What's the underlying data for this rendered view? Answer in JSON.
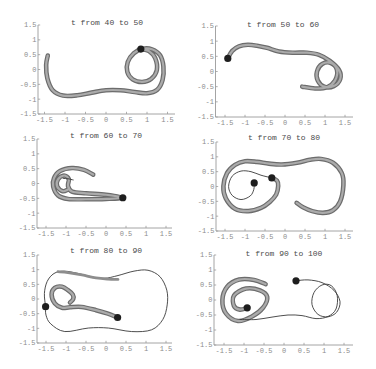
{
  "chart_data": [
    {
      "type": "line",
      "title": "t from 40 to 50",
      "xlabel": "",
      "ylabel": "",
      "xlim": [
        -1.5,
        1.5
      ],
      "ylim": [
        -1.5,
        1.5
      ],
      "grid": false,
      "legend": null,
      "xticks": [
        -1.5,
        -1,
        -0.5,
        0,
        0.5,
        1,
        1.5
      ],
      "xtick_labels": [
        "-1.5",
        "-1",
        "-0.5",
        "0",
        "0.5",
        "1",
        "1.5"
      ],
      "yticks": [
        1.5,
        1,
        0.5,
        0,
        -0.5,
        -1,
        -1.5
      ],
      "ytick_labels": [
        "1.5",
        "1",
        "0.5",
        "0",
        "-0.5",
        "-1",
        "-1.5"
      ],
      "series": [
        {
          "name": "thick trajectory",
          "style": "thick",
          "points": [
            [
              -1.42,
              0.47
            ],
            [
              -1.46,
              0.15
            ],
            [
              -1.43,
              -0.3
            ],
            [
              -1.3,
              -0.7
            ],
            [
              -1.05,
              -0.88
            ],
            [
              -0.7,
              -0.87
            ],
            [
              -0.35,
              -0.78
            ],
            [
              0.0,
              -0.7
            ],
            [
              0.35,
              -0.7
            ],
            [
              0.7,
              -0.76
            ],
            [
              1.0,
              -0.8
            ],
            [
              1.25,
              -0.68
            ],
            [
              1.38,
              -0.35
            ],
            [
              1.4,
              0.1
            ],
            [
              1.32,
              0.48
            ],
            [
              1.12,
              0.68
            ],
            [
              0.9,
              0.7
            ],
            [
              0.68,
              0.55
            ],
            [
              0.53,
              0.25
            ],
            [
              0.52,
              -0.08
            ],
            [
              0.65,
              -0.33
            ],
            [
              0.88,
              -0.42
            ],
            [
              1.1,
              -0.32
            ],
            [
              1.24,
              -0.02
            ],
            [
              1.2,
              0.38
            ],
            [
              1.05,
              0.62
            ],
            [
              0.85,
              0.69
            ]
          ]
        }
      ],
      "markers": [
        [
          0.85,
          0.69
        ]
      ]
    },
    {
      "type": "line",
      "title": "t from 50 to 60",
      "xlabel": "",
      "ylabel": "",
      "xlim": [
        -1.5,
        1.5
      ],
      "ylim": [
        -1.5,
        1.5
      ],
      "grid": false,
      "legend": null,
      "xticks": [
        -1.5,
        -1,
        -0.5,
        0,
        0.5,
        1,
        1.5
      ],
      "xtick_labels": [
        "-1.5",
        "-1",
        "-0.5",
        "0",
        "0.5",
        "1",
        "1.5"
      ],
      "yticks": [
        1.5,
        1,
        0.5,
        0,
        -0.5,
        -1,
        -1.5
      ],
      "ytick_labels": [
        "1.5",
        "1",
        "0.5",
        "0",
        "-0.5",
        "-1",
        "-1.5"
      ],
      "series": [
        {
          "name": "thick trajectory",
          "style": "thick",
          "points": [
            [
              -1.43,
              0.43
            ],
            [
              -1.32,
              0.68
            ],
            [
              -1.15,
              0.83
            ],
            [
              -0.93,
              0.88
            ],
            [
              -0.7,
              0.85
            ],
            [
              -0.45,
              0.78
            ],
            [
              -0.15,
              0.66
            ],
            [
              0.2,
              0.62
            ],
            [
              0.55,
              0.62
            ],
            [
              0.85,
              0.55
            ],
            [
              1.12,
              0.35
            ],
            [
              1.35,
              0.05
            ],
            [
              1.38,
              -0.25
            ],
            [
              1.22,
              -0.48
            ],
            [
              0.98,
              -0.5
            ],
            [
              0.82,
              -0.3
            ],
            [
              0.8,
              0.0
            ],
            [
              0.93,
              0.25
            ],
            [
              1.15,
              0.28
            ],
            [
              1.3,
              0.05
            ],
            [
              1.25,
              -0.3
            ],
            [
              1.05,
              -0.52
            ],
            [
              0.75,
              -0.56
            ],
            [
              0.43,
              -0.5
            ]
          ]
        }
      ],
      "markers": [
        [
          -1.43,
          0.43
        ]
      ]
    },
    {
      "type": "line",
      "title": "t from 60 to 70",
      "xlabel": "",
      "ylabel": "",
      "xlim": [
        -1.5,
        1.5
      ],
      "ylim": [
        -1.5,
        1.5
      ],
      "grid": false,
      "legend": null,
      "xticks": [
        -1.5,
        -1,
        -0.5,
        0,
        0.5,
        1,
        1.5
      ],
      "xtick_labels": [
        "-1.5",
        "-1",
        "-0.5",
        "0",
        "0.5",
        "1",
        "1.5"
      ],
      "yticks": [
        1.5,
        1,
        0.5,
        0,
        -0.5,
        -1,
        -1.5
      ],
      "ytick_labels": [
        "1.5",
        "1",
        "0.5",
        "0",
        "-0.5",
        "-1",
        "-1.5"
      ],
      "series": [
        {
          "name": "thick trajectory",
          "style": "thick",
          "points": [
            [
              -0.32,
              0.3
            ],
            [
              -0.55,
              0.46
            ],
            [
              -0.85,
              0.52
            ],
            [
              -1.15,
              0.42
            ],
            [
              -1.3,
              0.18
            ],
            [
              -1.32,
              -0.1
            ],
            [
              -1.2,
              -0.4
            ],
            [
              -0.95,
              -0.52
            ],
            [
              -0.5,
              -0.53
            ],
            [
              0.0,
              -0.52
            ],
            [
              0.42,
              -0.48
            ],
            [
              0.0,
              -0.38
            ],
            [
              -0.5,
              -0.33
            ],
            [
              -0.85,
              -0.27
            ],
            [
              -0.95,
              -0.08
            ],
            [
              -0.93,
              0.15
            ],
            [
              -1.05,
              0.27
            ],
            [
              -1.2,
              0.14
            ],
            [
              -1.22,
              -0.1
            ],
            [
              -1.08,
              -0.26
            ],
            [
              -0.95,
              -0.2
            ]
          ]
        },
        {
          "name": "thin trajectory",
          "style": "thin",
          "points": [
            [
              -1.07,
              0.17
            ],
            [
              -0.95,
              0.16
            ],
            [
              -0.82,
              0.12
            ]
          ]
        }
      ],
      "markers": [
        [
          0.42,
          -0.48
        ]
      ]
    },
    {
      "type": "line",
      "title": "t from 70 to 80",
      "xlabel": "",
      "ylabel": "",
      "xlim": [
        -1.5,
        1.5
      ],
      "ylim": [
        -1.5,
        1.5
      ],
      "grid": false,
      "legend": null,
      "xticks": [
        -1.5,
        -1,
        -0.5,
        0,
        0.5,
        1,
        1.5
      ],
      "xtick_labels": [
        "-1.5",
        "-1",
        "-0.5",
        "0",
        "0.5",
        "1",
        "1.5"
      ],
      "yticks": [
        1.5,
        1,
        0.5,
        0,
        -0.5,
        -1,
        -1.5
      ],
      "ytick_labels": [
        "1.5",
        "1",
        "0.5",
        "0",
        "-0.5",
        "-1",
        "-1.5"
      ],
      "series": [
        {
          "name": "thick trajectory",
          "style": "thick",
          "points": [
            [
              -0.33,
              0.29
            ],
            [
              -0.2,
              0.2
            ],
            [
              -0.17,
              0.02
            ],
            [
              -0.22,
              -0.27
            ],
            [
              -0.38,
              -0.52
            ],
            [
              -0.6,
              -0.72
            ],
            [
              -0.92,
              -0.83
            ],
            [
              -1.25,
              -0.75
            ],
            [
              -1.48,
              -0.4
            ],
            [
              -1.54,
              0.01
            ],
            [
              -1.45,
              0.45
            ],
            [
              -1.25,
              0.73
            ],
            [
              -1.0,
              0.85
            ],
            [
              -0.7,
              0.83
            ],
            [
              -0.4,
              0.77
            ],
            [
              -0.08,
              0.74
            ],
            [
              0.3,
              0.8
            ],
            [
              0.62,
              0.9
            ],
            [
              0.9,
              0.93
            ],
            [
              1.2,
              0.8
            ],
            [
              1.42,
              0.45
            ],
            [
              1.46,
              0.05
            ],
            [
              1.38,
              -0.5
            ],
            [
              1.2,
              -0.8
            ],
            [
              0.95,
              -0.89
            ],
            [
              0.68,
              -0.83
            ],
            [
              0.45,
              -0.7
            ],
            [
              0.29,
              -0.55
            ]
          ]
        },
        {
          "name": "thin trajectory",
          "style": "thin",
          "points": [
            [
              -0.77,
              0.12
            ],
            [
              -0.78,
              -0.1
            ],
            [
              -0.87,
              -0.32
            ],
            [
              -1.1,
              -0.44
            ],
            [
              -1.32,
              -0.3
            ],
            [
              -1.41,
              0.0
            ],
            [
              -1.32,
              0.35
            ],
            [
              -1.1,
              0.52
            ],
            [
              -0.85,
              0.5
            ],
            [
              -0.6,
              0.38
            ],
            [
              -0.33,
              0.29
            ]
          ]
        }
      ],
      "markers": [
        [
          -0.77,
          0.12
        ],
        [
          -0.33,
          0.29
        ]
      ]
    },
    {
      "type": "line",
      "title": "t from 80 to 90",
      "xlabel": "",
      "ylabel": "",
      "xlim": [
        -1.5,
        1.5
      ],
      "ylim": [
        -1.5,
        1.5
      ],
      "grid": false,
      "legend": null,
      "xticks": [
        -1.5,
        -1,
        -0.5,
        0,
        0.5,
        1,
        1.5
      ],
      "xtick_labels": [
        "-1.5",
        "-1",
        "-0.5",
        "0",
        "0.5",
        "1",
        "1.5"
      ],
      "yticks": [
        1.5,
        1,
        0.5,
        0,
        -0.5,
        -1,
        -1.5
      ],
      "ytick_labels": [
        "1.5",
        "1",
        "0.5",
        "0",
        "-0.5",
        "-1",
        "-1.5"
      ],
      "series": [
        {
          "name": "thin trajectory",
          "style": "thin",
          "points": [
            [
              -1.51,
              -0.26
            ],
            [
              -1.54,
              0.19
            ],
            [
              -1.47,
              0.6
            ],
            [
              -1.3,
              0.87
            ],
            [
              -1.05,
              0.95
            ],
            [
              -0.69,
              0.87
            ],
            [
              -0.35,
              0.75
            ],
            [
              -0.05,
              0.7
            ],
            [
              0.3,
              0.8
            ],
            [
              0.7,
              0.95
            ],
            [
              1.05,
              0.98
            ],
            [
              1.35,
              0.76
            ],
            [
              1.52,
              0.3
            ],
            [
              1.53,
              -0.2
            ],
            [
              1.42,
              -0.7
            ],
            [
              1.14,
              -1.05
            ],
            [
              0.64,
              -1.11
            ],
            [
              0.06,
              -0.99
            ],
            [
              -0.44,
              -0.99
            ],
            [
              -1.03,
              -1.11
            ],
            [
              -1.38,
              -0.85
            ],
            [
              -1.5,
              -0.55
            ],
            [
              -1.51,
              -0.26
            ]
          ]
        },
        {
          "name": "medium trajectory",
          "style": "medium",
          "points": [
            [
              -1.2,
              0.93
            ],
            [
              -0.95,
              0.9
            ],
            [
              -0.6,
              0.82
            ],
            [
              -0.25,
              0.72
            ],
            [
              0.05,
              0.68
            ],
            [
              0.3,
              0.67
            ]
          ]
        },
        {
          "name": "thick trajectory",
          "style": "thick",
          "points": [
            [
              0.29,
              -0.63
            ],
            [
              0.05,
              -0.5
            ],
            [
              -0.25,
              -0.38
            ],
            [
              -0.61,
              -0.27
            ],
            [
              -0.9,
              -0.28
            ],
            [
              -1.1,
              -0.3
            ],
            [
              -1.28,
              -0.15
            ],
            [
              -1.36,
              0.15
            ],
            [
              -1.28,
              0.38
            ],
            [
              -1.1,
              0.42
            ],
            [
              -0.95,
              0.3
            ],
            [
              -0.83,
              0.15
            ],
            [
              -0.82,
              0.0
            ],
            [
              -0.9,
              -0.12
            ]
          ]
        }
      ],
      "markers": [
        [
          -1.51,
          -0.26
        ],
        [
          0.29,
          -0.63
        ]
      ]
    },
    {
      "type": "line",
      "title": "t from 90 to 100",
      "xlabel": "",
      "ylabel": "",
      "xlim": [
        -1.5,
        1.5
      ],
      "ylim": [
        -1.5,
        1.5
      ],
      "grid": false,
      "legend": null,
      "xticks": [
        -1.5,
        -1,
        -0.5,
        0,
        0.5,
        1,
        1.5
      ],
      "xtick_labels": [
        "-1.5",
        "-1",
        "-0.5",
        "0",
        "0.5",
        "1",
        "1.5"
      ],
      "yticks": [
        1.5,
        1,
        0.5,
        0,
        -0.5,
        -1,
        -1.5
      ],
      "ytick_labels": [
        "1.5",
        "1",
        "0.5",
        "0",
        "-0.5",
        "-1",
        "-1.5"
      ],
      "series": [
        {
          "name": "thick trajectory",
          "style": "thick",
          "points": [
            [
              -0.46,
              0.53
            ],
            [
              -0.75,
              0.67
            ],
            [
              -1.12,
              0.68
            ],
            [
              -1.42,
              0.44
            ],
            [
              -1.54,
              0.0
            ],
            [
              -1.45,
              -0.45
            ],
            [
              -1.15,
              -0.7
            ],
            [
              -0.8,
              -0.55
            ],
            [
              -0.52,
              -0.25
            ],
            [
              -0.42,
              0.1
            ],
            [
              -0.6,
              0.32
            ],
            [
              -0.95,
              0.38
            ],
            [
              -1.25,
              0.15
            ],
            [
              -1.25,
              -0.2
            ],
            [
              -1.1,
              -0.32
            ],
            [
              -0.92,
              -0.26
            ]
          ]
        },
        {
          "name": "thin trajectory",
          "style": "thin",
          "points": [
            [
              0.3,
              0.64
            ],
            [
              0.6,
              0.67
            ],
            [
              0.95,
              0.58
            ],
            [
              1.25,
              0.32
            ],
            [
              1.4,
              -0.05
            ],
            [
              1.32,
              -0.4
            ],
            [
              1.1,
              -0.56
            ],
            [
              0.85,
              -0.48
            ],
            [
              0.7,
              -0.15
            ],
            [
              0.75,
              0.25
            ],
            [
              0.95,
              0.5
            ],
            [
              1.18,
              0.48
            ],
            [
              1.33,
              0.15
            ],
            [
              1.3,
              -0.3
            ],
            [
              1.1,
              -0.55
            ],
            [
              0.8,
              -0.62
            ],
            [
              0.45,
              -0.52
            ],
            [
              0.1,
              -0.5
            ],
            [
              -0.3,
              -0.57
            ],
            [
              -0.7,
              -0.65
            ],
            [
              -1.1,
              -0.65
            ]
          ]
        }
      ],
      "markers": [
        [
          -0.92,
          -0.26
        ],
        [
          0.3,
          0.64
        ]
      ]
    }
  ]
}
